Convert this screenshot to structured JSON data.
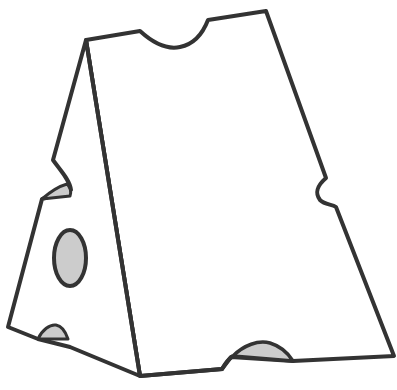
{
  "image": {
    "subject": "cheese wedge line drawing",
    "colors": {
      "background": "#ffffff",
      "outline": "#333333",
      "hole_fill": "#cccccc",
      "face_fill": "#ffffff"
    }
  }
}
